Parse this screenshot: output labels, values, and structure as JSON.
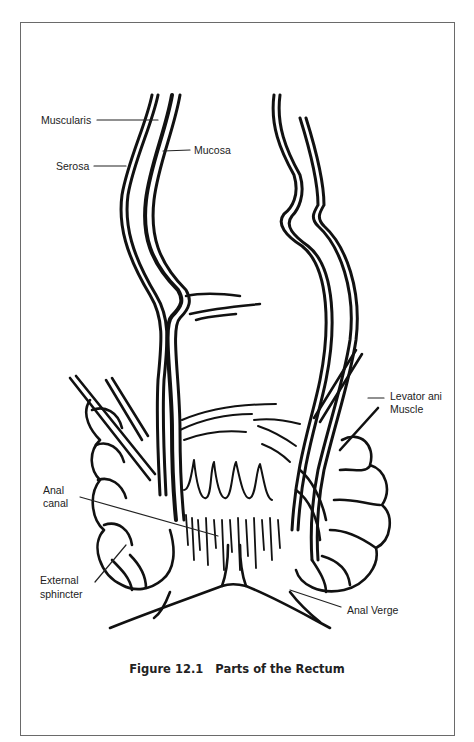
{
  "figure": {
    "number": "Figure 12.1",
    "title": "Parts of the Rectum"
  },
  "labels": {
    "muscularis": "Muscularis",
    "serosa": "Serosa",
    "mucosa": "Mucosa",
    "levator_line1": "Levator ani",
    "levator_line2": "Muscle",
    "anal_canal_line1": "Anal",
    "anal_canal_line2": "canal",
    "external_line1": "External",
    "external_line2": "sphincter",
    "anal_verge": "Anal Verge"
  },
  "colors": {
    "ink": "#111111",
    "frame": "#6a6a6a",
    "text": "#222222"
  }
}
